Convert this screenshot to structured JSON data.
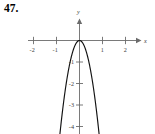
{
  "figure": {
    "problem_number": "47.",
    "axis_labels": {
      "x": "x",
      "y": "y"
    }
  },
  "chart_data": {
    "type": "line",
    "title": "",
    "subtitle": "",
    "xlabel": "x",
    "ylabel": "y",
    "grid": false,
    "legend": "none",
    "xlim": [
      -2.4,
      2.4
    ],
    "ylim": [
      -4.8,
      0.35
    ],
    "x_ticks": [
      -2,
      -1,
      1,
      2
    ],
    "x_tick_labels": [
      "-2",
      "-1",
      "1",
      "2"
    ],
    "y_ticks": [
      -1,
      -2,
      -3,
      -4
    ],
    "y_tick_labels": [
      "-1",
      "-2",
      "-3",
      "-4"
    ],
    "annotations": [],
    "series": [
      {
        "name": "downward parabola, vertex at origin",
        "equation": "y = -6x^2",
        "vertex": [
          0,
          0
        ],
        "opens": "down",
        "coefficient": -6,
        "x": [
          -0.88,
          -0.8,
          -0.7,
          -0.6,
          -0.5,
          -0.4,
          -0.3,
          -0.2,
          -0.1,
          0,
          0.1,
          0.2,
          0.3,
          0.4,
          0.5,
          0.6,
          0.7,
          0.8,
          0.88
        ],
        "values": [
          -4.65,
          -3.84,
          -2.94,
          -2.16,
          -1.5,
          -0.96,
          -0.54,
          -0.24,
          -0.06,
          0,
          -0.06,
          -0.24,
          -0.54,
          -0.96,
          -1.5,
          -2.16,
          -2.94,
          -3.84,
          -4.65
        ]
      }
    ]
  },
  "colors": {
    "curve": "#111111",
    "axis": "#6b6b6b",
    "text": "#3a3a3a",
    "background": "#ffffff"
  }
}
